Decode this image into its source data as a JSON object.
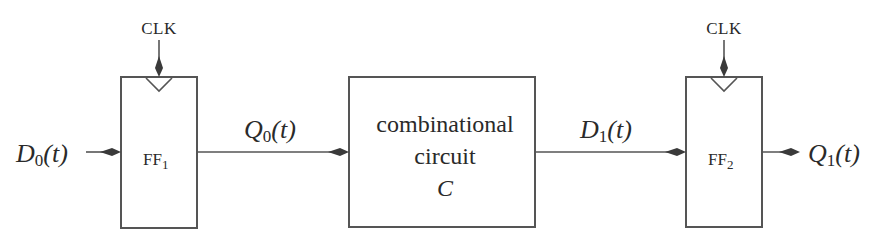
{
  "diagram": {
    "colors": {
      "stroke": "#555555",
      "arrow": "#3a3a3a",
      "text": "#2a2a2a",
      "background": "#ffffff"
    },
    "nodes": {
      "ff1": {
        "label": "FF",
        "subscript": "1",
        "clock_label": "CLK"
      },
      "comb": {
        "line1": "combinational",
        "line2": "circuit",
        "line3": "C"
      },
      "ff2": {
        "label": "FF",
        "subscript": "2",
        "clock_label": "CLK"
      }
    },
    "signals": {
      "d0": {
        "name": "D",
        "subscript": "0",
        "arg": "(t)"
      },
      "q0": {
        "name": "Q",
        "subscript": "0",
        "arg": "(t)"
      },
      "d1": {
        "name": "D",
        "subscript": "1",
        "arg": "(t)"
      },
      "q1": {
        "name": "Q",
        "subscript": "1",
        "arg": "(t)"
      }
    },
    "edges": [
      {
        "from": "D0(t)",
        "to": "FF1"
      },
      {
        "from": "FF1",
        "to": "combinational circuit C",
        "label": "Q0(t)"
      },
      {
        "from": "combinational circuit C",
        "to": "FF2",
        "label": "D1(t)"
      },
      {
        "from": "FF2",
        "to": "Q1(t)"
      },
      {
        "from": "CLK",
        "to": "FF1"
      },
      {
        "from": "CLK",
        "to": "FF2"
      }
    ]
  }
}
